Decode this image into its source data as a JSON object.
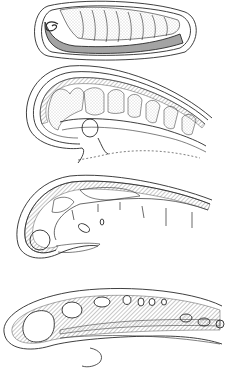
{
  "figure": {
    "background": "#ffffff",
    "ink": "#2a2a2a",
    "stipple": "#9a9a9a",
    "panels": [
      {
        "id": "panel-1",
        "description": "egg-shaped capsule containing coiled segmented embryo with dark hatched yolk",
        "y_range": [
          0,
          62
        ]
      },
      {
        "id": "panel-2",
        "description": "curved embryo section with stippled lobed segments and circular organ",
        "y_range": [
          62,
          170
        ]
      },
      {
        "id": "panel-3",
        "description": "curved section with hatched wall, chambers and hanging septa",
        "y_range": [
          170,
          268
        ]
      },
      {
        "id": "panel-4",
        "description": "elongated hatched section with oval cavities and trailing filament",
        "y_range": [
          268,
          373
        ]
      }
    ]
  }
}
